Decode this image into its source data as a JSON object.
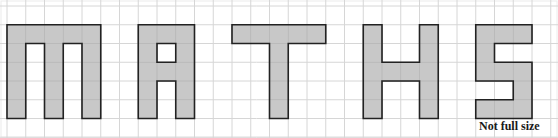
{
  "diagram": {
    "word": "MATHS",
    "caption": "Not full size",
    "grid": {
      "columns": 29,
      "rows": 7
    },
    "colors": {
      "grid_line": "#d6d6d6",
      "letter_fill": "#c8c8c8",
      "letter_outline": "#222222",
      "background": "#ffffff"
    },
    "letters": [
      {
        "name": "M",
        "col": 0,
        "row": 1,
        "cells": [
          "11111",
          "10101",
          "10101",
          "10101",
          "10101"
        ]
      },
      {
        "name": "A",
        "col": 7,
        "row": 1,
        "cells": [
          "111",
          "101",
          "111",
          "101",
          "101"
        ]
      },
      {
        "name": "T",
        "col": 12,
        "row": 1,
        "cells": [
          "11111",
          "00100",
          "00100",
          "00100",
          "00100"
        ]
      },
      {
        "name": "H",
        "col": 19,
        "row": 1,
        "cells": [
          "1001",
          "1001",
          "1111",
          "1001",
          "1001"
        ]
      },
      {
        "name": "S",
        "col": 25,
        "row": 1,
        "cells": [
          "111",
          "100",
          "111",
          "001",
          "111"
        ]
      }
    ]
  }
}
